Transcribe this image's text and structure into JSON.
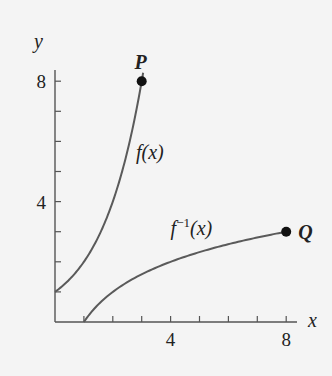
{
  "chart_data": {
    "type": "line",
    "title": "",
    "xlabel": "x",
    "ylabel": "y",
    "xlim": [
      0,
      8.4
    ],
    "ylim": [
      0,
      8.4
    ],
    "x_ticks": [
      1,
      2,
      3,
      4,
      5,
      6,
      7,
      8
    ],
    "y_ticks": [
      1,
      2,
      3,
      4,
      5,
      6,
      7,
      8
    ],
    "x_tick_labels": [
      {
        "value": 4,
        "label": "4"
      },
      {
        "value": 8,
        "label": "8"
      }
    ],
    "y_tick_labels": [
      {
        "value": 4,
        "label": "4"
      },
      {
        "value": 8,
        "label": "8"
      }
    ],
    "grid": false,
    "series": [
      {
        "name": "f(x)",
        "label_main": "f",
        "label_sup": "",
        "label_arg": "(x)",
        "function": "2^x",
        "domain": [
          0,
          3
        ],
        "x": [
          0,
          0.5,
          1,
          1.5,
          2,
          2.5,
          3
        ],
        "y": [
          1,
          1.41,
          2,
          2.83,
          4,
          5.66,
          8
        ]
      },
      {
        "name": "f^-1(x)",
        "label_main": "f",
        "label_sup": "−1",
        "label_arg": "(x)",
        "function": "log2(x)",
        "domain": [
          1,
          8
        ],
        "x": [
          1,
          1.41,
          2,
          2.83,
          4,
          5.66,
          8
        ],
        "y": [
          0,
          0.5,
          1,
          1.5,
          2,
          2.5,
          3
        ]
      }
    ],
    "points": [
      {
        "name": "P",
        "x": 3,
        "y": 8
      },
      {
        "name": "Q",
        "x": 8,
        "y": 3
      }
    ]
  }
}
